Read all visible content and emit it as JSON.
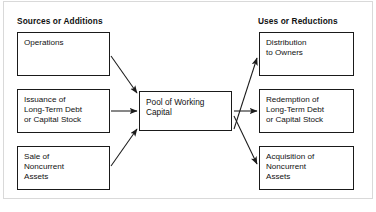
{
  "figure": {
    "background_color": "#ffffff",
    "line_color": "#1a1a1a",
    "frame_color": "#d9d9d9"
  },
  "headings": {
    "left": "Sources or Additions",
    "right": "Uses or Reductions"
  },
  "center": {
    "label": "Pool of Working\nCapital"
  },
  "sources": [
    {
      "id": "operations",
      "label": "Operations"
    },
    {
      "id": "issuance",
      "label": "Issuance of\nLong-Term Debt\nor Capital Stock"
    },
    {
      "id": "sale",
      "label": "Sale of\nNoncurrent\nAssets"
    }
  ],
  "uses": [
    {
      "id": "distribution",
      "label": "Distribution\nto Owners"
    },
    {
      "id": "redemption",
      "label": "Redemption of\nLong-Term Debt\nor Capital Stock"
    },
    {
      "id": "acquisition",
      "label": "Acquisition of\nNoncurrent\nAssets"
    }
  ],
  "arrows": [
    {
      "id": "operations-to-pool",
      "from": "operations",
      "to": "pool",
      "direction": "into-pool"
    },
    {
      "id": "issuance-to-pool",
      "from": "issuance",
      "to": "pool",
      "direction": "into-pool"
    },
    {
      "id": "sale-to-pool",
      "from": "sale",
      "to": "pool",
      "direction": "into-pool"
    },
    {
      "id": "pool-to-distribution",
      "from": "pool",
      "to": "distribution",
      "direction": "out-of-pool"
    },
    {
      "id": "pool-to-redemption",
      "from": "pool",
      "to": "redemption",
      "direction": "out-of-pool"
    },
    {
      "id": "pool-to-acquisition",
      "from": "pool",
      "to": "acquisition",
      "direction": "out-of-pool"
    }
  ]
}
